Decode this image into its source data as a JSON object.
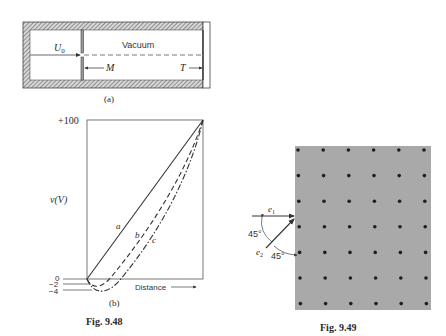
{
  "figure_948": {
    "caption": "Fig. 9.48",
    "panel_a": {
      "label": "(a)",
      "region_label": "Vacuum",
      "beam_label": "U",
      "beam_subscript": "0",
      "mesh_label": "M",
      "target_label": "T"
    },
    "panel_b": {
      "label": "(b)",
      "y_axis_label": "v(V)",
      "x_axis_label": "Distance",
      "y_tick_top": "+100",
      "y_tick_zero": "0",
      "y_tick_minus2": "−2",
      "y_tick_minus4": "−4",
      "curve_a_label": "a",
      "curve_b_label": "b",
      "curve_c_label": "c"
    }
  },
  "figure_949": {
    "caption": "Fig. 9.49",
    "beam1_label": "e",
    "beam1_subscript": "1",
    "beam2_label": "e",
    "beam2_subscript": "2",
    "angle1_label": "45°",
    "angle2_label": "45°",
    "lattice_rows": 7,
    "lattice_cols": 6
  },
  "colors": {
    "line": "#333333",
    "hatch": "#8a8a8a",
    "lattice_bg": "#a9a9a9",
    "atom": "#1e1e1e"
  },
  "chart_data": {
    "type": "line",
    "title": "",
    "xlabel": "Distance",
    "ylabel": "v(V)",
    "ylim": [
      -4,
      100
    ],
    "y_ticks": [
      "+100",
      "0",
      "-2",
      "-4"
    ],
    "series": [
      {
        "name": "a",
        "style": "solid",
        "x": [
          0,
          0.25,
          0.5,
          0.75,
          1.0
        ],
        "y": [
          0,
          25,
          50,
          75,
          100
        ]
      },
      {
        "name": "b",
        "style": "dashed",
        "x": [
          0,
          0.1,
          0.25,
          0.5,
          0.75,
          1.0
        ],
        "y": [
          0,
          -2,
          8,
          35,
          66,
          100
        ]
      },
      {
        "name": "c",
        "style": "dash-dot",
        "x": [
          0,
          0.15,
          0.3,
          0.5,
          0.75,
          1.0
        ],
        "y": [
          0,
          -4,
          3,
          25,
          58,
          100
        ]
      }
    ]
  }
}
